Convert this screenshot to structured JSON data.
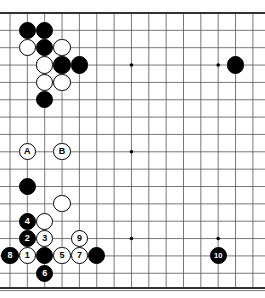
{
  "board": {
    "title": "Go board diagram",
    "style": {
      "line_color": "#555555",
      "border_color": "#333333",
      "background": "#ffffff",
      "black_color": "#000000",
      "white_color": "#ffffff"
    },
    "geometry": {
      "left": 10,
      "top": 13,
      "right": 253,
      "bottom": 288,
      "spacing": 17.35,
      "cols": 15,
      "rows": 16,
      "stone_radius": 8.6
    },
    "star_points": [
      {
        "col": 7,
        "row": 3
      },
      {
        "col": 7,
        "row": 8
      },
      {
        "col": 7,
        "row": 13
      },
      {
        "col": 12,
        "row": 3
      },
      {
        "col": 12,
        "row": 13
      }
    ],
    "stones": [
      {
        "col": 1,
        "row": 1,
        "color": "black",
        "label": ""
      },
      {
        "col": 2,
        "row": 1,
        "color": "black",
        "label": ""
      },
      {
        "col": 1,
        "row": 2,
        "color": "white",
        "label": ""
      },
      {
        "col": 2,
        "row": 2,
        "color": "black",
        "label": ""
      },
      {
        "col": 3,
        "row": 2,
        "color": "white",
        "label": ""
      },
      {
        "col": 2,
        "row": 3,
        "color": "white",
        "label": ""
      },
      {
        "col": 3,
        "row": 3,
        "color": "black",
        "label": ""
      },
      {
        "col": 4,
        "row": 3,
        "color": "black",
        "label": ""
      },
      {
        "col": 2,
        "row": 4,
        "color": "white",
        "label": ""
      },
      {
        "col": 3,
        "row": 4,
        "color": "white",
        "label": ""
      },
      {
        "col": 2,
        "row": 5,
        "color": "black",
        "label": ""
      },
      {
        "col": 13,
        "row": 3,
        "color": "black",
        "label": ""
      },
      {
        "col": 1,
        "row": 10,
        "color": "black",
        "label": ""
      },
      {
        "col": 3,
        "row": 11,
        "color": "white",
        "label": ""
      },
      {
        "col": 1,
        "row": 12,
        "color": "black",
        "label": "4"
      },
      {
        "col": 2,
        "row": 12,
        "color": "white",
        "label": ""
      },
      {
        "col": 1,
        "row": 13,
        "color": "black",
        "label": "2"
      },
      {
        "col": 2,
        "row": 13,
        "color": "white",
        "label": "3"
      },
      {
        "col": 4,
        "row": 13,
        "color": "white",
        "label": "9"
      },
      {
        "col": 0,
        "row": 14,
        "color": "black",
        "label": "8"
      },
      {
        "col": 1,
        "row": 14,
        "color": "white",
        "label": "1"
      },
      {
        "col": 2,
        "row": 14,
        "color": "black",
        "label": ""
      },
      {
        "col": 3,
        "row": 14,
        "color": "white",
        "label": "5"
      },
      {
        "col": 4,
        "row": 14,
        "color": "white",
        "label": "7"
      },
      {
        "col": 5,
        "row": 14,
        "color": "black",
        "label": ""
      },
      {
        "col": 2,
        "row": 15,
        "color": "black",
        "label": "6"
      },
      {
        "col": 12,
        "row": 14,
        "color": "black",
        "label": "10"
      }
    ],
    "markers": [
      {
        "col": 1,
        "row": 8,
        "label": "A"
      },
      {
        "col": 3,
        "row": 8,
        "label": "B"
      }
    ]
  }
}
